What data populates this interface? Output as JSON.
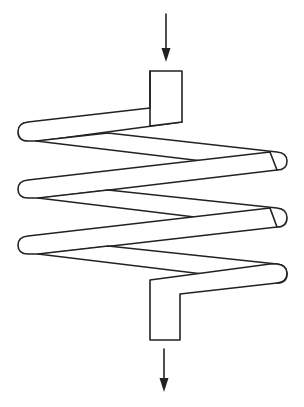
{
  "diagram": {
    "stroke_color": "#222222",
    "background_color": "#ffffff",
    "elements": [
      {
        "name": "inlet-arrow",
        "direction": "down",
        "position": "top"
      },
      {
        "name": "inlet-pipe",
        "position": "top"
      },
      {
        "name": "coil",
        "turns": 3
      },
      {
        "name": "outlet-pipe",
        "position": "bottom"
      },
      {
        "name": "outlet-arrow",
        "direction": "down",
        "position": "bottom"
      }
    ]
  }
}
